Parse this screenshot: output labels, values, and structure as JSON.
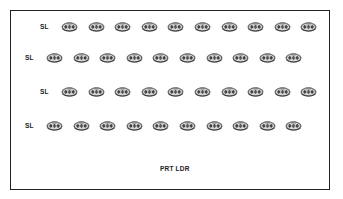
{
  "diagram": {
    "type": "seating-layout",
    "rows": [
      {
        "label": "SL",
        "count": 10,
        "label_x": 40,
        "first_x": 61,
        "y": 21
      },
      {
        "label": "SL",
        "count": 10,
        "label_x": 25,
        "first_x": 46,
        "y": 52
      },
      {
        "label": "SL",
        "count": 10,
        "label_x": 40,
        "first_x": 61,
        "y": 86
      },
      {
        "label": "SL",
        "count": 10,
        "label_x": 25,
        "first_x": 46,
        "y": 120
      }
    ],
    "icon": "squad-member-icon",
    "icon_spacing": 26.6,
    "footer_label": "PRT LDR",
    "colors": {
      "border": "#222222",
      "icon": "#555555",
      "text": "#222222"
    }
  }
}
